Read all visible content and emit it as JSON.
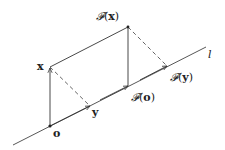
{
  "diagram": {
    "line_label": "l",
    "points": {
      "o": {
        "label": "o",
        "x": 50,
        "y": 126
      },
      "x": {
        "label": "x",
        "x": 50,
        "y": 67
      },
      "y": {
        "label": "y",
        "x": 90,
        "y": 106
      },
      "Fx": {
        "label_func": "𝓕",
        "label_arg": "x",
        "x": 128,
        "y": 27
      },
      "Fo": {
        "label_func": "𝓕",
        "label_arg": "o",
        "x": 128,
        "y": 86
      },
      "Fy": {
        "label_func": "𝓕",
        "label_arg": "y",
        "x": 167,
        "y": 66
      }
    },
    "paren_open": "(",
    "paren_close": ")",
    "stroke_color": "#333333"
  }
}
